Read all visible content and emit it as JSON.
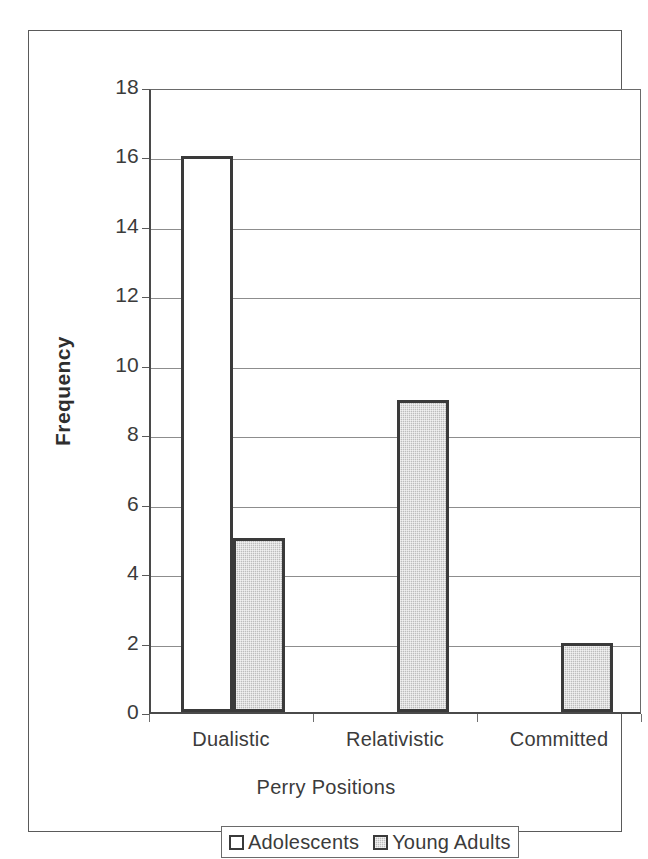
{
  "chart_data": {
    "type": "bar",
    "title": "",
    "xlabel": "Perry Positions",
    "ylabel": "Frequency",
    "categories": [
      "Dualistic",
      "Relativistic",
      "Committed"
    ],
    "series": [
      {
        "name": "Adolescents",
        "values": [
          16,
          0,
          0
        ],
        "color": "#ffffff"
      },
      {
        "name": "Young Adults",
        "values": [
          5,
          9,
          2
        ],
        "color": "#bdbdbd"
      }
    ],
    "ylim": [
      0,
      18
    ],
    "ytick_values": [
      18,
      16,
      14,
      12,
      10,
      8,
      6,
      4,
      2,
      0
    ],
    "ytick_labels": [
      "18",
      "16",
      "14",
      "12",
      "10",
      "8",
      "6",
      "4",
      "2",
      "0"
    ],
    "ytick_step": 2,
    "grid": "horizontal",
    "legend_position": "bottom",
    "legend_entries": [
      "Adolescents",
      "Young Adults"
    ],
    "bar_border_color": "#3a3a3a",
    "axis_color": "#4a4a4a",
    "grid_color": "#8d8d8d",
    "frame_color": "#5a5a5a",
    "background_color": "#ffffff"
  }
}
